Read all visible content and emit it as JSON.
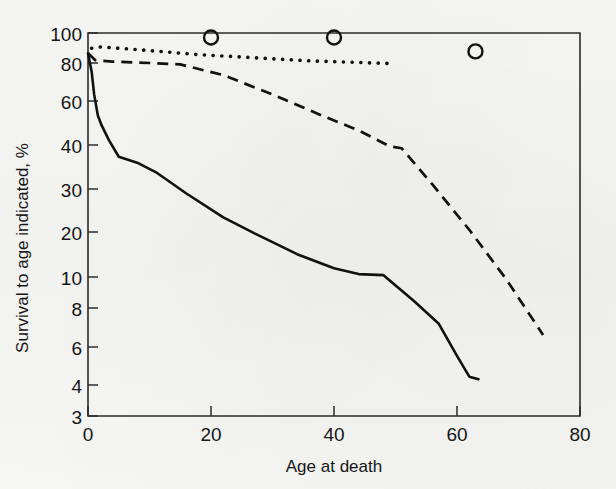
{
  "chart_data": {
    "type": "line",
    "title": "",
    "xlabel": "Age at death",
    "ylabel": "Survival to age indicated, %",
    "xlim": [
      0,
      80
    ],
    "ylim": [
      3,
      100
    ],
    "yscale": "log",
    "grid": false,
    "legend": "none",
    "xticks": [
      0,
      20,
      40,
      60,
      80
    ],
    "xtick_labels": [
      "0",
      "20",
      "40",
      "60",
      "80"
    ],
    "yticks": [
      3,
      4,
      6,
      8,
      10,
      20,
      30,
      40,
      60,
      80,
      100
    ],
    "ytick_labels": [
      "3",
      "4",
      "6",
      "8",
      "10",
      "20",
      "30",
      "40",
      "60",
      "80",
      "100"
    ],
    "series": [
      {
        "name": "solid-curve",
        "style": "solid",
        "points": [
          [
            0.0,
            83.0
          ],
          [
            0.6,
            70.0
          ],
          [
            1.0,
            57.0
          ],
          [
            1.6,
            47.0
          ],
          [
            2.2,
            43.0
          ],
          [
            3.4,
            37.5
          ],
          [
            5.0,
            32.2
          ],
          [
            8.0,
            30.5
          ],
          [
            11.0,
            28.0
          ],
          [
            16.0,
            23.0
          ],
          [
            22.0,
            18.5
          ],
          [
            27.0,
            16.0
          ],
          [
            34.0,
            13.2
          ],
          [
            40.0,
            11.6
          ],
          [
            44.0,
            11.0
          ],
          [
            48.0,
            10.9
          ],
          [
            53.0,
            8.6
          ],
          [
            57.0,
            7.0
          ],
          [
            60.0,
            5.2
          ],
          [
            62.0,
            4.3
          ],
          [
            63.5,
            4.2
          ]
        ]
      },
      {
        "name": "dashed-curve",
        "style": "dashed",
        "points": [
          [
            0.0,
            83.0
          ],
          [
            1.2,
            78.0
          ],
          [
            4.0,
            77.0
          ],
          [
            10.0,
            76.0
          ],
          [
            15.0,
            75.0
          ],
          [
            22.0,
            68.0
          ],
          [
            30.0,
            57.0
          ],
          [
            38.0,
            47.0
          ],
          [
            44.0,
            41.0
          ],
          [
            49.0,
            35.5
          ],
          [
            51.0,
            34.8
          ],
          [
            56.0,
            25.0
          ],
          [
            62.0,
            16.5
          ],
          [
            68.0,
            10.5
          ],
          [
            74.0,
            6.3
          ]
        ]
      },
      {
        "name": "dotted-curve",
        "style": "dotted",
        "points": [
          [
            0.6,
            87.0
          ],
          [
            2.0,
            88.0
          ],
          [
            5.0,
            87.0
          ],
          [
            9.0,
            85.5
          ],
          [
            13.0,
            84.0
          ],
          [
            18.0,
            82.0
          ],
          [
            24.0,
            80.5
          ],
          [
            30.0,
            79.0
          ],
          [
            36.0,
            77.5
          ],
          [
            43.0,
            76.5
          ],
          [
            50.0,
            75.5
          ]
        ]
      }
    ],
    "markers": [
      {
        "name": "open-circle-20",
        "x": 20,
        "y": 96.0,
        "shape": "open-circle"
      },
      {
        "name": "open-circle-40",
        "x": 40,
        "y": 96.0,
        "shape": "open-circle"
      },
      {
        "name": "open-circle-63",
        "x": 63,
        "y": 84.5,
        "shape": "open-circle"
      }
    ]
  },
  "figure": {
    "background_color": "#f6f6f4",
    "ink_color": "#111111"
  }
}
